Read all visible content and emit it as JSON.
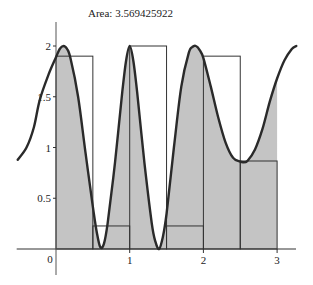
{
  "chart_data": {
    "type": "area",
    "title": "Area: 3.569425922",
    "xlabel": "",
    "ylabel": "",
    "xlim": [
      -0.52,
      3.3
    ],
    "ylim": [
      -0.45,
      2.25
    ],
    "grid": false,
    "x_ticks": [
      {
        "value": 0,
        "label": "0"
      },
      {
        "value": 1,
        "label": "1"
      },
      {
        "value": 2,
        "label": "2"
      },
      {
        "value": 3,
        "label": "3"
      }
    ],
    "y_ticks": [
      {
        "value": 0.5,
        "label": "0.5"
      },
      {
        "value": 1,
        "label": "1"
      },
      {
        "value": 1.5,
        "label": "1.5"
      },
      {
        "value": 2,
        "label": "2"
      }
    ],
    "integration_interval": [
      0,
      3
    ],
    "rectangles": [
      {
        "x0": 0.0,
        "x1": 0.5,
        "height": 1.9
      },
      {
        "x0": 0.5,
        "x1": 1.0,
        "height": 0.227
      },
      {
        "x0": 1.0,
        "x1": 1.5,
        "height": 2.0
      },
      {
        "x0": 1.5,
        "x1": 2.0,
        "height": 0.227
      },
      {
        "x0": 2.0,
        "x1": 2.5,
        "height": 1.9
      },
      {
        "x0": 2.5,
        "x1": 3.0,
        "height": 0.867
      }
    ],
    "curve": {
      "x": [
        -0.52,
        -0.4,
        -0.3,
        -0.22,
        -0.1,
        0.0,
        0.05,
        0.1,
        0.15,
        0.2,
        0.3,
        0.4,
        0.5,
        0.55,
        0.6,
        0.65,
        0.7,
        0.8,
        0.9,
        0.95,
        1.0,
        1.05,
        1.1,
        1.2,
        1.3,
        1.35,
        1.4,
        1.45,
        1.5,
        1.6,
        1.7,
        1.8,
        1.85,
        1.9,
        1.95,
        2.0,
        2.1,
        2.2,
        2.3,
        2.4,
        2.5,
        2.55,
        2.6,
        2.7,
        2.8,
        2.9,
        3.0,
        3.1,
        3.2,
        3.26
      ],
      "y": [
        0.88,
        1.0,
        1.2,
        1.47,
        1.72,
        1.89,
        1.97,
        2.0,
        1.97,
        1.87,
        1.5,
        0.95,
        0.42,
        0.18,
        0.02,
        0.05,
        0.25,
        0.85,
        1.55,
        1.85,
        2.0,
        1.85,
        1.55,
        0.85,
        0.25,
        0.07,
        0.0,
        0.12,
        0.35,
        1.0,
        1.6,
        1.93,
        1.99,
        2.0,
        1.96,
        1.88,
        1.6,
        1.3,
        1.05,
        0.9,
        0.86,
        0.855,
        0.87,
        0.98,
        1.18,
        1.45,
        1.68,
        1.86,
        1.97,
        2.0
      ]
    }
  }
}
